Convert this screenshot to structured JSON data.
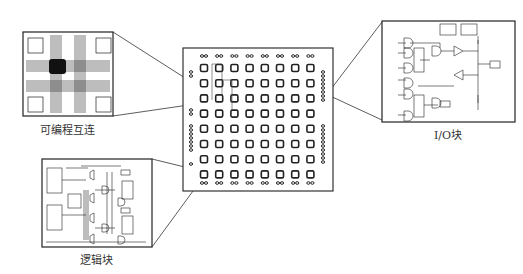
{
  "figure": {
    "labels": {
      "interconnect": "可编程互连",
      "io_block": "I/O块",
      "logic_block": "逻辑块"
    },
    "chip": {
      "grid_rows": 8,
      "grid_cols": 8,
      "io_pads_top": 8,
      "io_pads_bottom": 8
    },
    "colors": {
      "line": "#222222",
      "background": "#ffffff"
    }
  }
}
